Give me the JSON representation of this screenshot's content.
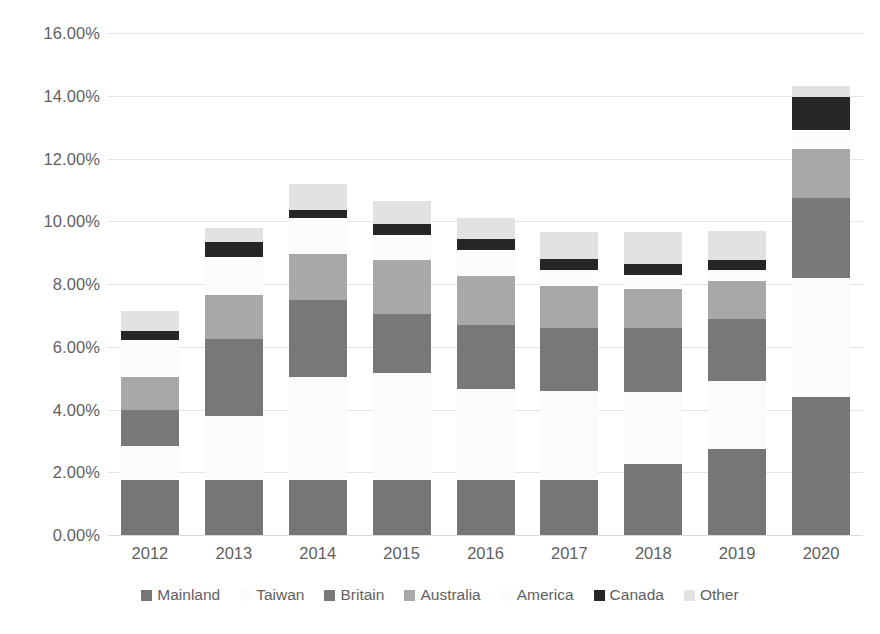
{
  "chart_data": {
    "type": "bar",
    "stacked": true,
    "title": "",
    "xlabel": "",
    "ylabel": "",
    "categories": [
      "2012",
      "2013",
      "2014",
      "2015",
      "2016",
      "2017",
      "2018",
      "2019",
      "2020"
    ],
    "ylim": [
      0,
      16
    ],
    "ytick_labels": [
      "0.00%",
      "2.00%",
      "4.00%",
      "6.00%",
      "8.00%",
      "10.00%",
      "12.00%",
      "14.00%",
      "16.00%"
    ],
    "ytick_values": [
      0,
      2,
      4,
      6,
      8,
      10,
      12,
      14,
      16
    ],
    "yaxis_unit": "%",
    "grid": true,
    "legend_position": "bottom",
    "series": [
      {
        "name": "Mainland",
        "color": "#767676",
        "values": [
          1.75,
          1.75,
          1.75,
          1.75,
          1.75,
          1.75,
          2.25,
          2.75,
          4.4
        ]
      },
      {
        "name": "Taiwan",
        "color": "#fbfbfb",
        "values": [
          1.1,
          2.05,
          3.3,
          3.4,
          2.9,
          2.85,
          2.3,
          2.15,
          3.8
        ]
      },
      {
        "name": "Britain",
        "color": "#787878",
        "values": [
          1.15,
          2.45,
          2.45,
          1.9,
          2.05,
          2.0,
          2.05,
          2.0,
          2.55
        ]
      },
      {
        "name": "Australia",
        "color": "#a8a8a8",
        "values": [
          1.05,
          1.4,
          1.45,
          1.7,
          1.55,
          1.35,
          1.25,
          1.2,
          1.55
        ]
      },
      {
        "name": "America",
        "color": "#fcfcfc",
        "values": [
          1.15,
          1.2,
          1.15,
          0.8,
          0.85,
          0.5,
          0.45,
          0.35,
          0.6
        ]
      },
      {
        "name": "Canada",
        "color": "#262626",
        "values": [
          0.3,
          0.5,
          0.25,
          0.35,
          0.35,
          0.35,
          0.35,
          0.3,
          1.05
        ]
      },
      {
        "name": "Other",
        "color": "#e2e2e2",
        "values": [
          0.65,
          0.45,
          0.85,
          0.75,
          0.65,
          0.85,
          1.0,
          0.95,
          0.35
        ]
      }
    ],
    "totals": [
      7.15,
      9.8,
      11.2,
      10.65,
      10.1,
      9.65,
      9.65,
      9.7,
      14.3
    ]
  }
}
